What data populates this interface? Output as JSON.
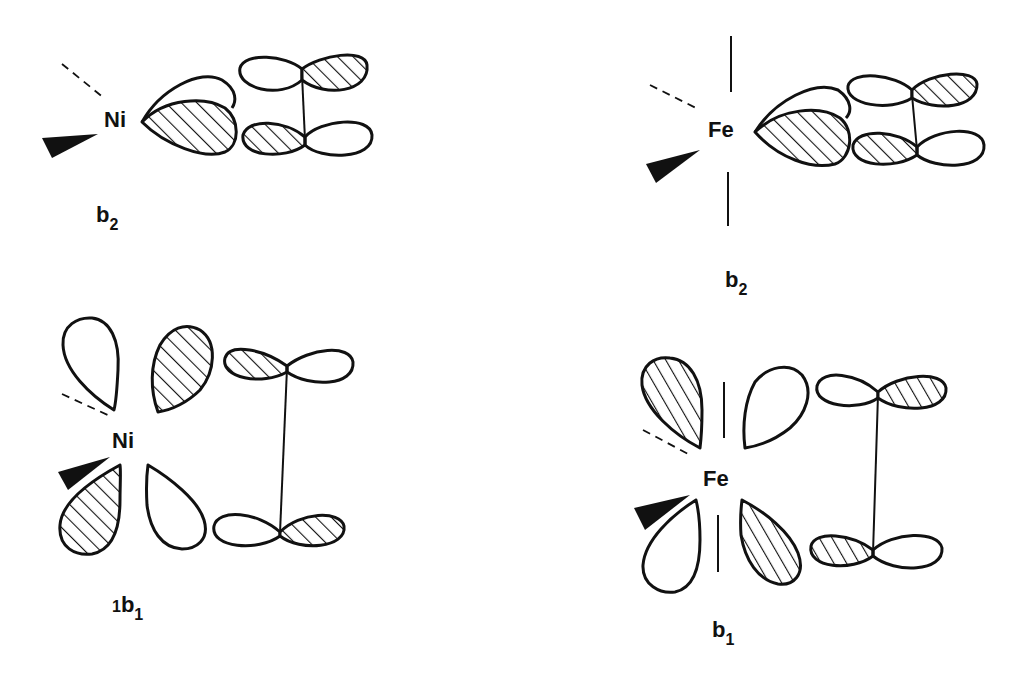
{
  "panels": [
    {
      "id": "ni-b2",
      "metal": "Ni",
      "label": "b",
      "subscript": "2",
      "prefix": ""
    },
    {
      "id": "fe-b2",
      "metal": "Fe",
      "label": "b",
      "subscript": "2",
      "prefix": ""
    },
    {
      "id": "ni-1b1",
      "metal": "Ni",
      "label": "b",
      "subscript": "1",
      "prefix": "1"
    },
    {
      "id": "fe-b1",
      "metal": "Fe",
      "label": "b",
      "subscript": "1",
      "prefix": ""
    }
  ],
  "colors": {
    "ink": "#111111",
    "background": "#ffffff"
  }
}
